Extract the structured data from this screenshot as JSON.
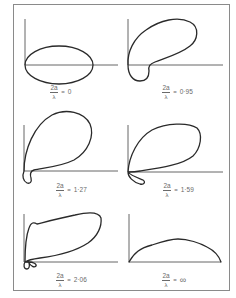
{
  "figure": {
    "panels": [
      {
        "id": "p1",
        "numerator": "2a",
        "denominator": "λ",
        "equals": "=",
        "value": "0"
      },
      {
        "id": "p2",
        "numerator": "2a",
        "denominator": "λ",
        "equals": "=",
        "value": "0·95"
      },
      {
        "id": "p3",
        "numerator": "2a",
        "denominator": "λ",
        "equals": "=",
        "value": "1·27"
      },
      {
        "id": "p4",
        "numerator": "2a",
        "denominator": "λ",
        "equals": "=",
        "value": "1·59"
      },
      {
        "id": "p5",
        "numerator": "2a",
        "denominator": "λ",
        "equals": "=",
        "value": "2·06"
      },
      {
        "id": "p6",
        "numerator": "2a",
        "denominator": "λ",
        "equals": "=",
        "value": "∞"
      }
    ],
    "colors": {
      "curve": "#2a2a2a",
      "axis": "#555555",
      "frame": "#8a8a8a",
      "label": "#6a6a6a"
    }
  }
}
